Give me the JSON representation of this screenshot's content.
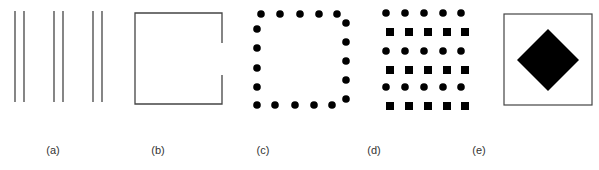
{
  "figure": {
    "panels": [
      {
        "id": "a",
        "label": "(a)",
        "description": "three pairs of vertical parallel lines"
      },
      {
        "id": "b",
        "label": "(b)",
        "description": "square outline with a gap in the right side"
      },
      {
        "id": "c",
        "label": "(c)",
        "description": "dots arranged around a square perimeter"
      },
      {
        "id": "d",
        "label": "(d)",
        "description": "alternating rows of circles and squares"
      },
      {
        "id": "e",
        "label": "(e)",
        "description": "filled black diamond inside a square outline"
      }
    ],
    "colors": {
      "stroke": "#444444",
      "fill": "#000000",
      "background": "#ffffff",
      "label": "#333333"
    }
  }
}
